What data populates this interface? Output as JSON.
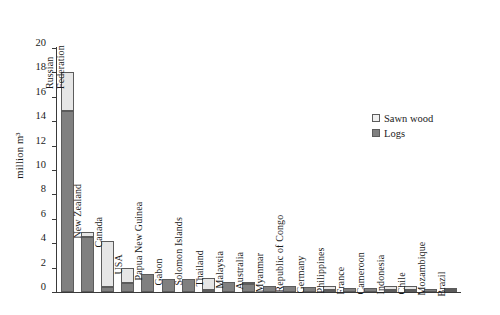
{
  "chart_data": {
    "type": "bar",
    "stacked": true,
    "title": "",
    "xlabel": "",
    "ylabel": "million m³",
    "ylim": [
      0,
      20
    ],
    "ytick_step": 2,
    "yticks": [
      "20",
      "18",
      "16",
      "14",
      "12",
      "10",
      "8",
      "6",
      "4",
      "2",
      "0"
    ],
    "grid": false,
    "legend_position": "upper right",
    "legend": [
      "Sawn wood",
      "Logs"
    ],
    "colors": {
      "sawn_wood": "#e6e6e6",
      "logs": "#808080",
      "outline": "#5c5c5c"
    },
    "categories": [
      "Russian Federation",
      "New Zealand",
      "Canada",
      "USA",
      "Papua New Guinea",
      "Gabon",
      "Solomon Islands",
      "Thailand",
      "Malaysia",
      "Australia",
      "Myanmar",
      "Republic of Congo",
      "Germany",
      "Philippines",
      "France",
      "Cameroon",
      "Indonesia",
      "Chile",
      "Mozambique",
      "Brazil"
    ],
    "category_label_lines": [
      [
        "Russian",
        "Federation"
      ],
      [
        "New Zealand"
      ],
      [
        "Canada"
      ],
      [
        "USA"
      ],
      [
        "Papua New Guinea"
      ],
      [
        "Gabon"
      ],
      [
        "Solomon Islands"
      ],
      [
        "Thailand"
      ],
      [
        "Malaysia"
      ],
      [
        "Australia"
      ],
      [
        "Myanmar"
      ],
      [
        "Republic of Congo"
      ],
      [
        "Germany"
      ],
      [
        "Philippines"
      ],
      [
        "France"
      ],
      [
        "Cameroon"
      ],
      [
        "Indonesia"
      ],
      [
        "Chile"
      ],
      [
        "Mozambique"
      ],
      [
        "Brazil"
      ]
    ],
    "series": [
      {
        "name": "Logs",
        "values": [
          14.8,
          4.55,
          0.45,
          0.75,
          1.45,
          1.1,
          1.1,
          0.05,
          0.8,
          0.65,
          0.5,
          0.5,
          0.4,
          0.05,
          0.35,
          0.35,
          0.05,
          0.05,
          0.22,
          0.08
        ]
      },
      {
        "name": "Sawn wood",
        "values": [
          3.2,
          0.35,
          3.75,
          1.2,
          0.0,
          0.0,
          0.0,
          0.95,
          0.0,
          0.05,
          0.0,
          0.0,
          0.0,
          0.35,
          0.0,
          0.0,
          0.3,
          0.3,
          0.0,
          0.05
        ]
      }
    ],
    "totals": [
      18.0,
      4.9,
      4.2,
      1.95,
      1.45,
      1.1,
      1.1,
      1.0,
      0.8,
      0.7,
      0.5,
      0.5,
      0.4,
      0.4,
      0.35,
      0.35,
      0.35,
      0.35,
      0.22,
      0.13
    ]
  }
}
